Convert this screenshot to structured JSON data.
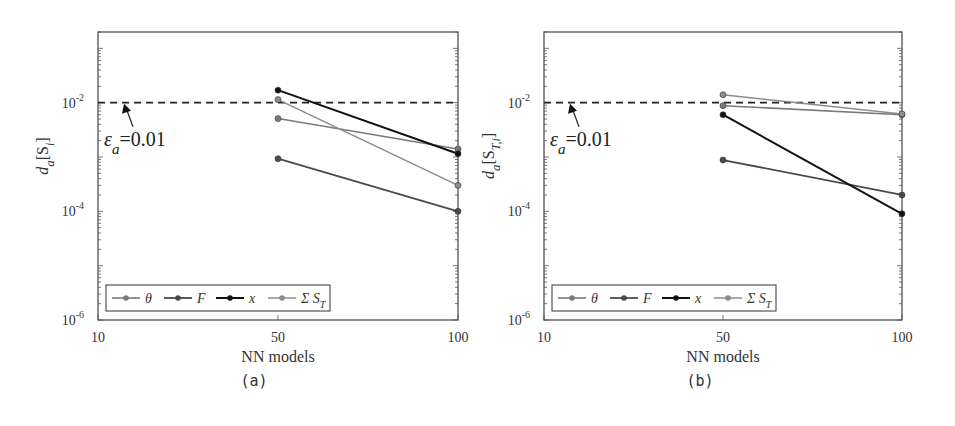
{
  "figure": {
    "panels": [
      {
        "caption": "(a)",
        "ylabel": "d_a[S_i]",
        "ylabel_main": "d",
        "ylabel_sub": "a",
        "ylabel_bracket": "[S",
        "ylabel_bracket_sub": "i",
        "ylabel_close": "]",
        "xlabel": "NN models",
        "annotation": {
          "prefix": "ε",
          "sub": "a",
          "text": "=0.01"
        }
      },
      {
        "caption": "(b)",
        "ylabel": "d_a[S_T,i]",
        "ylabel_main": "d",
        "ylabel_sub": "a",
        "ylabel_bracket": "[S",
        "ylabel_bracket_sub": "T,i",
        "ylabel_close": "]",
        "xlabel": "NN models",
        "annotation": {
          "prefix": "ε",
          "sub": "a",
          "text": "=0.01"
        }
      }
    ],
    "xticks": [
      "10",
      "50",
      "100"
    ],
    "yticks": [
      {
        "base": "10",
        "exp": "-2"
      },
      {
        "base": "10",
        "exp": "-4"
      },
      {
        "base": "10",
        "exp": "-6"
      }
    ],
    "legend": [
      {
        "label": "θ",
        "color": "#7a7a7a"
      },
      {
        "label": "F",
        "color": "#4a4a4a"
      },
      {
        "label": "x",
        "color": "#111111"
      },
      {
        "label": "Σ S",
        "sub": "T",
        "color": "#8c8c8c"
      }
    ]
  },
  "chart_data": [
    {
      "type": "line",
      "title": "(a)",
      "xlabel": "NN models",
      "ylabel": "d_a[S_i]",
      "yscale": "log",
      "ylim": [
        1e-06,
        0.2
      ],
      "categories": [
        "10",
        "50",
        "100"
      ],
      "threshold": {
        "label": "ε_a=0.01",
        "value": 0.01,
        "style": "dashed"
      },
      "series": [
        {
          "name": "θ",
          "x": [
            50,
            100
          ],
          "values": [
            0.0051,
            0.0014
          ]
        },
        {
          "name": "F",
          "x": [
            50,
            100
          ],
          "values": [
            0.00093,
            0.0001
          ]
        },
        {
          "name": "x",
          "x": [
            50,
            100
          ],
          "values": [
            0.017,
            0.00115
          ]
        },
        {
          "name": "Σ S_T",
          "x": [
            50,
            100
          ],
          "values": [
            0.0114,
            0.0003
          ]
        }
      ],
      "legend_position": "lower left",
      "grid": false
    },
    {
      "type": "line",
      "title": "(b)",
      "xlabel": "NN models",
      "ylabel": "d_a[S_T,i]",
      "yscale": "log",
      "ylim": [
        1e-06,
        0.2
      ],
      "categories": [
        "10",
        "50",
        "100"
      ],
      "threshold": {
        "label": "ε_a=0.01",
        "value": 0.01,
        "style": "dashed"
      },
      "series": [
        {
          "name": "θ",
          "x": [
            50,
            100
          ],
          "values": [
            0.0088,
            0.006
          ]
        },
        {
          "name": "F",
          "x": [
            50,
            100
          ],
          "values": [
            0.00088,
            0.0002
          ]
        },
        {
          "name": "x",
          "x": [
            50,
            100
          ],
          "values": [
            0.006,
            9e-05
          ]
        },
        {
          "name": "Σ S_T",
          "x": [
            50,
            100
          ],
          "values": [
            0.014,
            0.0062
          ]
        }
      ],
      "legend_position": "lower left",
      "grid": false
    }
  ]
}
